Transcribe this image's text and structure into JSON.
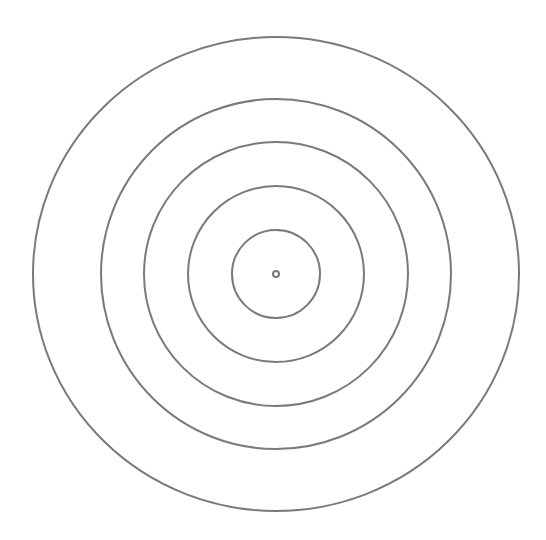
{
  "diagram": {
    "type": "concentric-circles",
    "background": "#ffffff",
    "stroke_color": "#7a7a7a",
    "stroke_width": 2,
    "center": {
      "x": 276,
      "y": 274
    },
    "circles": [
      {
        "name": "center-dot",
        "r": 3
      },
      {
        "name": "ring-1",
        "r": 44
      },
      {
        "name": "ring-2",
        "r": 88
      },
      {
        "name": "ring-3",
        "r": 132
      },
      {
        "name": "ring-4",
        "r": 175
      },
      {
        "name": "ring-5",
        "rx": 243,
        "ry": 237
      }
    ]
  }
}
